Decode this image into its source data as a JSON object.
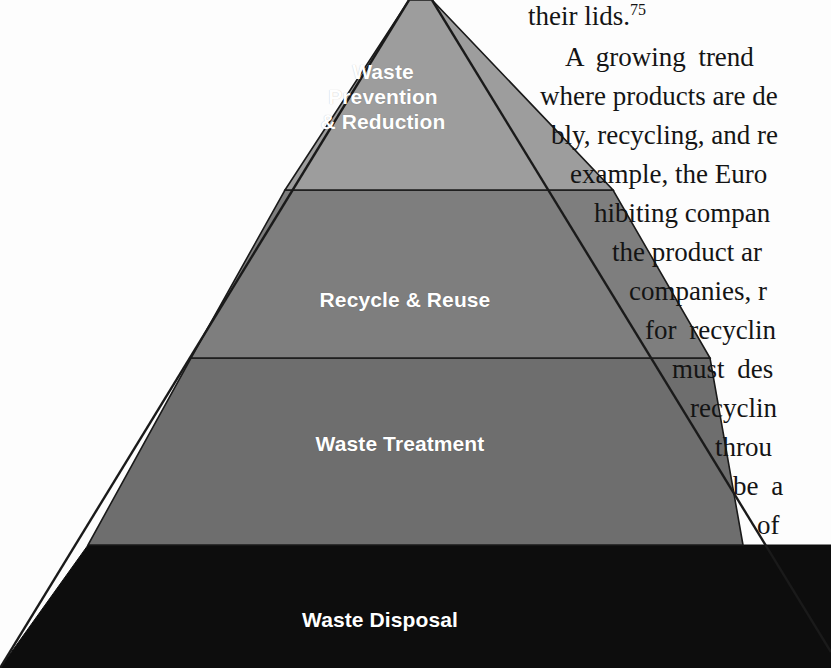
{
  "figure": {
    "name": "waste-hierarchy-pyramid",
    "type": "pyramid",
    "orientation": "apex-top",
    "apex_cropped": true,
    "bands": [
      {
        "id": "waste-prevention-reduction",
        "label": "Waste\nPrevention\n& Reduction",
        "rank": 1,
        "fill": "#9d9d9d",
        "text_color": "#ffffff"
      },
      {
        "id": "recycle-reuse",
        "label": "Recycle & Reuse",
        "rank": 2,
        "fill": "#7e7e7e",
        "text_color": "#ffffff"
      },
      {
        "id": "waste-treatment",
        "label": "Waste Treatment",
        "rank": 3,
        "fill": "#6e6e6e",
        "text_color": "#ffffff"
      },
      {
        "id": "waste-disposal",
        "label": "Waste Disposal",
        "rank": 4,
        "fill": "#0d0d0d",
        "text_color": "#ffffff"
      }
    ],
    "outline_color": "#1a1a1a"
  },
  "body_text": {
    "lines": [
      {
        "id": "line-lids",
        "text": "their lids.",
        "superscript": "75",
        "left": 528,
        "top": 3,
        "justified": false
      },
      {
        "id": "line-growing",
        "text": "A growing  trend",
        "left": 565,
        "top": 44,
        "justified": true
      },
      {
        "id": "line-products",
        "text": "where products are de",
        "left": 540,
        "top": 83,
        "justified": false
      },
      {
        "id": "line-recycling",
        "text": "bly, recycling, and re",
        "left": 551,
        "top": 122,
        "justified": false
      },
      {
        "id": "line-european",
        "text": "example, the Euro",
        "left": 570,
        "top": 161,
        "justified": false
      },
      {
        "id": "line-hibiting",
        "text": "hibiting compan",
        "left": 594,
        "top": 200,
        "justified": false
      },
      {
        "id": "line-product",
        "text": "the product ar",
        "left": 612,
        "top": 239,
        "justified": false
      },
      {
        "id": "line-companies",
        "text": "companies, r",
        "left": 629,
        "top": 278,
        "justified": false
      },
      {
        "id": "line-forrecy",
        "text": "for  recyclin",
        "left": 645,
        "top": 317,
        "justified": true
      },
      {
        "id": "line-mustdes",
        "text": "must  des",
        "left": 672,
        "top": 356,
        "justified": true
      },
      {
        "id": "line-recyclin2",
        "text": "recyclin",
        "left": 690,
        "top": 395,
        "justified": false
      },
      {
        "id": "line-throu",
        "text": "throu",
        "left": 715,
        "top": 434,
        "justified": false
      },
      {
        "id": "line-bea",
        "text": "be  a",
        "left": 733,
        "top": 473,
        "justified": true
      },
      {
        "id": "line-of",
        "text": "of",
        "left": 757,
        "top": 512,
        "justified": false
      }
    ]
  },
  "colors": {
    "page_background": "#fdfdfd",
    "band_1": "#9d9d9d",
    "band_2": "#7e7e7e",
    "band_3": "#6e6e6e",
    "band_4": "#0d0d0d",
    "label_text": "#ffffff",
    "body_text": "#141414"
  }
}
